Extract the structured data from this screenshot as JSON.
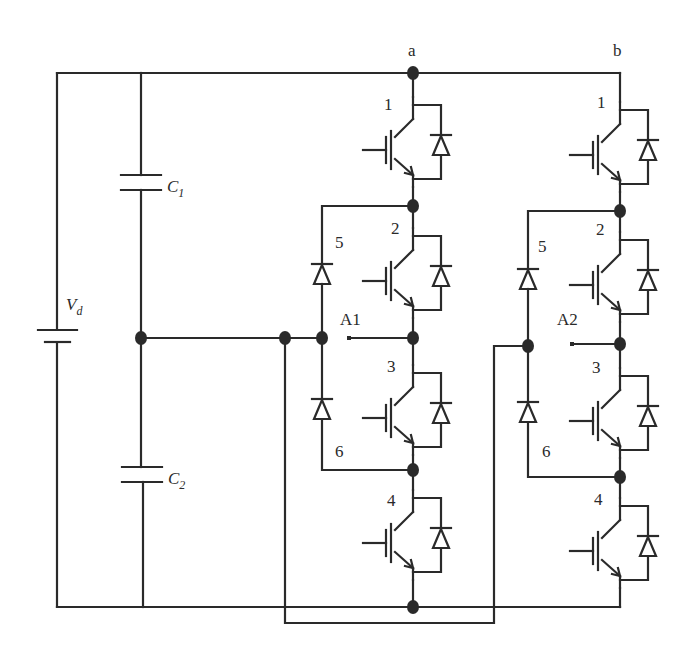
{
  "diagram": {
    "type": "three-level neutral-point-clamped (NPC) inverter, two legs",
    "source_label": "V",
    "source_label_sub": "d",
    "capacitors": [
      {
        "label": "C",
        "sub": "1"
      },
      {
        "label": "C",
        "sub": "2"
      }
    ],
    "legs": [
      {
        "top_label": "a",
        "output_label": "A1",
        "switch_labels": [
          "1",
          "2",
          "3",
          "4"
        ],
        "clamp_diode_labels": [
          "5",
          "6"
        ]
      },
      {
        "top_label": "b",
        "output_label": "A2",
        "switch_labels": [
          "1",
          "2",
          "3",
          "4"
        ],
        "clamp_diode_labels": [
          "5",
          "6"
        ]
      }
    ],
    "colors": {
      "line": "#2a2a2a",
      "background": "#ffffff"
    }
  }
}
